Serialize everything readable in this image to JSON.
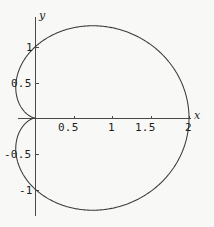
{
  "figure": {
    "background_color": "#f8f8f6",
    "curve_color": "#3a3a3a",
    "axis_color": "#4a4a4a",
    "x_axis_name": "x",
    "y_axis_name": "y"
  },
  "chart_data": {
    "type": "line",
    "title": "",
    "subtitle": "",
    "xlabel": "x",
    "ylabel": "y",
    "curve_name": "cardioid",
    "polar_equation": "r = 1 + cos(theta)",
    "grid": false,
    "legend": "none",
    "xlim": [
      -0.45,
      2.05
    ],
    "ylim": [
      -1.42,
      1.42
    ],
    "x_ticks": [
      0.5,
      1,
      1.5,
      2
    ],
    "x_tick_labels": [
      "0.5",
      "1",
      "1.5",
      "2"
    ],
    "y_ticks": [
      1,
      0.5,
      -0.5,
      -1
    ],
    "y_tick_labels": [
      "1",
      "0.5",
      "-0.5",
      "-1"
    ],
    "x": [
      2,
      1.9924,
      1.9698,
      1.933,
      1.883,
      1.8214,
      1.75,
      1.671,
      1.5868,
      1.5,
      1.4132,
      1.329,
      1.25,
      1.1786,
      1.117,
      1.067,
      1.0302,
      1.0076,
      1.0,
      0.9924,
      0.9698,
      0.933,
      0.883,
      0.8214,
      0.75,
      0.671,
      0.5868,
      0.5,
      0.4132,
      0.329,
      0.25,
      0.1786,
      0.117,
      0.067,
      0.0302,
      0.0076,
      0.0
    ],
    "y": [
      0,
      0.1737,
      0.342,
      0.5,
      0.6428,
      0.766,
      0.866,
      0.9397,
      0.9848,
      1.0,
      0.9848,
      0.9397,
      0.866,
      0.766,
      0.6428,
      0.5,
      0.342,
      0.1737,
      0.0,
      -0.1737,
      -0.342,
      -0.5,
      -0.6428,
      -0.766,
      -0.866,
      -0.9397,
      -0.9848,
      -1.0,
      -0.9848,
      -0.9397,
      -0.866,
      -0.766,
      -0.6428,
      -0.5,
      -0.342,
      -0.1737,
      0.0
    ],
    "note": "x,y listed for theta = 0..360 deg in 10 deg steps along r = 1 + cos(theta); upper half mirrored to lower half"
  },
  "labels": {
    "x_tick_0": "0.5",
    "x_tick_1": "1",
    "x_tick_2": "1.5",
    "x_tick_3": "2",
    "y_tick_0": "1",
    "y_tick_1": "0.5",
    "y_tick_2": "-0.5",
    "y_tick_3": "-1",
    "x_axis": "x",
    "y_axis": "y"
  }
}
